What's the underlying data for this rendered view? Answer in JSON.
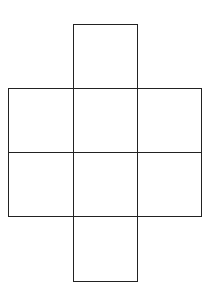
{
  "diagram": {
    "type": "cube-net",
    "line_color": "#222222",
    "background": "#ffffff",
    "cells": [
      {
        "id": "top",
        "row": 0,
        "col": 1
      },
      {
        "id": "middle-left",
        "row": 1,
        "col": 0
      },
      {
        "id": "middle-center",
        "row": 1,
        "col": 1
      },
      {
        "id": "middle-right",
        "row": 1,
        "col": 2
      },
      {
        "id": "lower-left",
        "row": 2,
        "col": 0
      },
      {
        "id": "lower-center",
        "row": 2,
        "col": 1
      },
      {
        "id": "lower-right",
        "row": 2,
        "col": 2
      },
      {
        "id": "bottom",
        "row": 3,
        "col": 1
      }
    ]
  }
}
